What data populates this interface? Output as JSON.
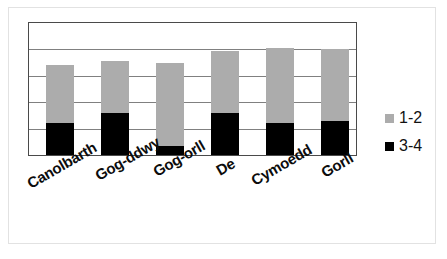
{
  "chart_data": {
    "type": "bar",
    "subtype": "stacked-column",
    "title": "",
    "subtitle": "",
    "xlabel": "",
    "ylabel": "",
    "ylim": [
      0,
      100
    ],
    "grid": true,
    "gridlines_percent": [
      20,
      40,
      60,
      80
    ],
    "legend_position": "right",
    "categories": [
      "Canolbarth",
      "Gog-ddwy",
      "Gog-orll",
      "De",
      "Cymoedd",
      "Gorll"
    ],
    "series": [
      {
        "name": "3-4",
        "color": "#000000",
        "values": [
          24,
          32,
          7,
          32,
          24,
          26
        ]
      },
      {
        "name": "1-2",
        "color": "#acacac",
        "values": [
          44,
          39,
          63,
          47,
          57,
          54
        ]
      }
    ],
    "totals": [
      68,
      71,
      70,
      79,
      81,
      80
    ],
    "stack_order_bottom_to_top": [
      "3-4",
      "1-2"
    ]
  },
  "legend": {
    "items": [
      {
        "label": "1-2",
        "color": "#acacac"
      },
      {
        "label": "3-4",
        "color": "#000000"
      }
    ]
  },
  "axis": {
    "x_tick_labels": [
      "Canolbarth",
      "Gog-ddwy",
      "Gog-orll",
      "De",
      "Cymoedd",
      "Gorll"
    ]
  },
  "colors": {
    "series_light": "#acacac",
    "series_dark": "#000000",
    "plot_border": "#4a4a4a",
    "gridline": "#808080",
    "outer_frame": "#e2e2e2",
    "background": "#ffffff",
    "label_text": "#0c0c0c"
  }
}
